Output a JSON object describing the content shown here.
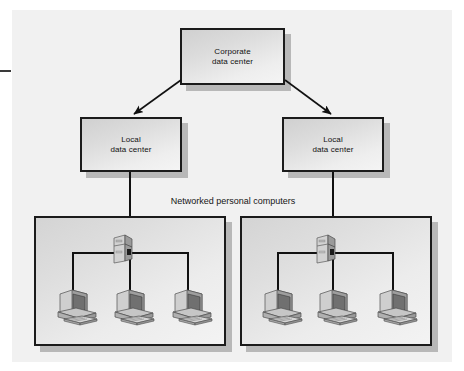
{
  "diagram": {
    "background_color": "#f1f1f1",
    "line_color": "#111111",
    "box_fill": "#dcdcdc",
    "box_border": "#1b1b1b",
    "shadow_color": "#b8b8b8"
  },
  "nodes": {
    "corporate": {
      "label": "Corporate\ndata center",
      "line1": "Corporate",
      "line2": "data center"
    },
    "local_left": {
      "label": "Local\ndata center",
      "line1": "Local",
      "line2": "data center"
    },
    "local_right": {
      "label": "Local\ndata center",
      "line1": "Local",
      "line2": "data center"
    }
  },
  "captions": {
    "networked_pcs": "Networked personal computers"
  },
  "lan_groups": [
    {
      "name": "left-lan",
      "server_icon": "server-tower-icon",
      "workstations": [
        "workstation-icon",
        "workstation-icon",
        "workstation-icon"
      ],
      "workstation_count": 3
    },
    {
      "name": "right-lan",
      "server_icon": "server-tower-icon",
      "workstations": [
        "workstation-icon",
        "workstation-icon",
        "workstation-icon"
      ],
      "workstation_count": 3
    }
  ],
  "connections": [
    {
      "from": "corporate",
      "to": "local_left",
      "style": "arrow"
    },
    {
      "from": "corporate",
      "to": "local_right",
      "style": "arrow"
    },
    {
      "from": "local_left",
      "to": "left-lan",
      "style": "line"
    },
    {
      "from": "local_right",
      "to": "right-lan",
      "style": "line"
    }
  ]
}
